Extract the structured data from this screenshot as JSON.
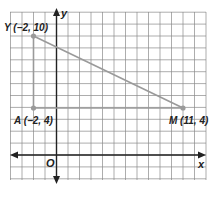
{
  "diagram": {
    "type": "coordinate-plane",
    "axes": {
      "x_label": "x",
      "y_label": "y",
      "origin_label": "O"
    },
    "grid": {
      "x_min": -4,
      "x_max": 13,
      "y_min": -2,
      "y_max": 12
    },
    "points": [
      {
        "name": "Y",
        "x": -2,
        "y": 10,
        "label": "Y (−2, 10)"
      },
      {
        "name": "A",
        "x": -2,
        "y": 4,
        "label": "A (−2, 4)"
      },
      {
        "name": "M",
        "x": 11,
        "y": 4,
        "label": "M (11, 4)"
      }
    ],
    "segments": [
      {
        "from": "Y",
        "to": "M",
        "color": "#9a9a9a"
      },
      {
        "from": "Y",
        "to": "A",
        "color": "#9a9a9a"
      },
      {
        "from": "A",
        "to": "M",
        "color": "#9a9a9a"
      }
    ],
    "colors": {
      "grid": "#8a8a8a",
      "axis": "#222222",
      "segment": "#9a9a9a",
      "point": "#9a9a9a"
    }
  }
}
